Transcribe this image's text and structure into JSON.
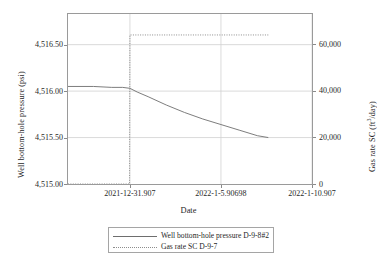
{
  "chart_data": {
    "type": "line",
    "title": "",
    "xlabel": "Date",
    "ylabel": "Well bottom-hole pressure (psi)",
    "ylabel_right": "Gas rate SC (ft3/day)",
    "ylabel_right_prefix": "Gas rate SC (ft",
    "ylabel_right_sup": "3",
    "ylabel_right_suffix": "/day)",
    "grid": true,
    "legend_position": "bottom-center",
    "x_tick_labels": [
      "2021-12-31.907",
      "2022-1-5.90698",
      "2022-1-10.907"
    ],
    "x_tick_values": [
      0.0,
      5.0,
      10.0
    ],
    "xlim": [
      -3.4,
      10.0
    ],
    "y_left_tick_labels": [
      "4,515.00",
      "4,515.50",
      "4,516.00",
      "4,516.50"
    ],
    "y_left_tick_values": [
      4515.0,
      4515.5,
      4516.0,
      4516.5
    ],
    "ylim_left": [
      4515.0,
      4516.83
    ],
    "y_right_tick_labels": [
      "0",
      "20,000",
      "40,000",
      "60,000"
    ],
    "y_right_tick_values": [
      0,
      20000,
      40000,
      60000
    ],
    "ylim_right": [
      0,
      73000
    ],
    "series": [
      {
        "name": "Well bottom-hole pressure D-9-8#2",
        "axis": "left",
        "style": "solid",
        "color": "#6e6e6e",
        "x": [
          -3.4,
          -2.0,
          -1.0,
          -0.4,
          0.0,
          0.4,
          1.0,
          2.0,
          3.0,
          4.0,
          5.0,
          6.0,
          7.0,
          7.6
        ],
        "y": [
          4516.05,
          4516.05,
          4516.04,
          4516.04,
          4516.03,
          4515.99,
          4515.94,
          4515.85,
          4515.77,
          4515.7,
          4515.64,
          4515.58,
          4515.52,
          4515.5
        ]
      },
      {
        "name": "Gas rate SC D-9-7",
        "axis": "right",
        "style": "dotted",
        "color": "#8d8d8d",
        "x": [
          -3.4,
          -0.02,
          0.0,
          1.0,
          2.0,
          3.0,
          4.0,
          5.0,
          6.0,
          7.0,
          7.6
        ],
        "y": [
          0,
          0,
          64000,
          64000,
          64000,
          64000,
          64000,
          64000,
          64000,
          64000,
          64000
        ]
      }
    ],
    "legend": [
      {
        "label": "Well bottom-hole pressure D-9-8#2",
        "style": "solid"
      },
      {
        "label": "Gas rate SC D-9-7",
        "style": "dotted"
      }
    ]
  }
}
